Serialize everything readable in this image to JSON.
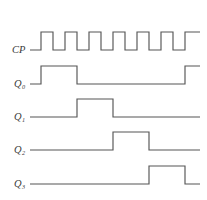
{
  "figure": {
    "stroke_color": "#555555",
    "background_color": "#ffffff",
    "label_color": "#3a3a3a"
  },
  "chart_data": {
    "type": "line",
    "title": "",
    "xlabel": "",
    "ylabel": "",
    "grid": false,
    "legend": "none",
    "axis": {
      "x_start_px": 30,
      "x_end_px": 200,
      "clock_period_px": 24,
      "clock_pulse_width_px": 12,
      "first_edge_px": 41
    },
    "series": [
      {
        "name": "CP",
        "label": "CP",
        "subscript": "",
        "row_index": 0,
        "low_y": 50,
        "high_y": 32,
        "start_level": 0,
        "transitions": [
          41,
          53,
          65,
          77,
          89,
          101,
          113,
          125,
          137,
          149,
          161,
          173,
          185
        ],
        "end_level": 1
      },
      {
        "name": "Q0",
        "label": "Q",
        "subscript": "0",
        "row_index": 1,
        "low_y": 84,
        "high_y": 66,
        "start_level": 0,
        "transitions": [
          41,
          77,
          185
        ],
        "end_level": 1
      },
      {
        "name": "Q1",
        "label": "Q",
        "subscript": "1",
        "row_index": 2,
        "low_y": 117,
        "high_y": 99,
        "start_level": 0,
        "transitions": [
          77,
          113
        ],
        "end_level": 0
      },
      {
        "name": "Q2",
        "label": "Q",
        "subscript": "2",
        "row_index": 3,
        "low_y": 150,
        "high_y": 132,
        "start_level": 0,
        "transitions": [
          113,
          149
        ],
        "end_level": 0
      },
      {
        "name": "Q3",
        "label": "Q",
        "subscript": "3",
        "row_index": 4,
        "low_y": 184,
        "high_y": 166,
        "start_level": 0,
        "transitions": [
          149,
          185
        ],
        "end_level": 0
      }
    ],
    "labels": [
      {
        "text": "CP",
        "sub": "",
        "x": 12,
        "y": 53
      },
      {
        "text": "Q",
        "sub": "0",
        "x": 14,
        "y": 87
      },
      {
        "text": "Q",
        "sub": "1",
        "x": 14,
        "y": 120
      },
      {
        "text": "Q",
        "sub": "2",
        "x": 14,
        "y": 153
      },
      {
        "text": "Q",
        "sub": "3",
        "x": 14,
        "y": 187
      }
    ]
  }
}
